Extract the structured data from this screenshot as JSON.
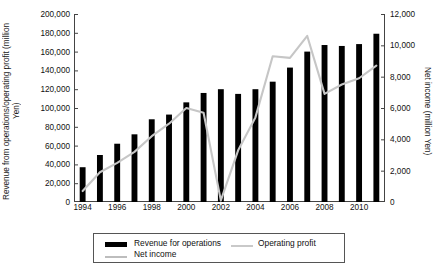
{
  "chart_data": {
    "type": "bar",
    "title": "",
    "subtitle": "",
    "xlabel": "",
    "ylabel": "Revenue from operations/operating profit (million Yen)",
    "y2label": "Net income (million Yen)",
    "ylim": [
      0,
      200000
    ],
    "y2lim": [
      0,
      12000
    ],
    "grid": false,
    "legend_position": "bottom",
    "categories": [
      "1994",
      "1995",
      "1996",
      "1997",
      "1998",
      "1999",
      "2000",
      "2001",
      "2002",
      "2003",
      "2004",
      "2005",
      "2006",
      "2007",
      "2008",
      "2009",
      "2010",
      "2011"
    ],
    "x_tick_labels": [
      "1994",
      "1996",
      "1998",
      "2000",
      "2002",
      "2004",
      "2006",
      "2008",
      "2010"
    ],
    "y_tick_labels": [
      "200,000",
      "180,000",
      "160,000",
      "140,000",
      "120,000",
      "100,000",
      "80,000",
      "60,000",
      "40,000",
      "20,000",
      "0"
    ],
    "y2_tick_labels": [
      "12,000",
      "10,000",
      "8,000",
      "6,000",
      "4,000",
      "2,000",
      "0"
    ],
    "series": [
      {
        "name": "Revenue for operations",
        "type": "bar",
        "axis": "left",
        "color": "#000000",
        "values": [
          37000,
          50000,
          62000,
          72000,
          88000,
          93000,
          106000,
          116000,
          120000,
          115000,
          120000,
          128000,
          143000,
          160000,
          167000,
          166000,
          168000,
          179000
        ]
      },
      {
        "name": "Operating profit",
        "type": "line",
        "axis": "left",
        "color": "#e2e2e2",
        "values": [
          null,
          null,
          null,
          null,
          null,
          null,
          null,
          null,
          null,
          null,
          null,
          null,
          null,
          null,
          null,
          null,
          null,
          null
        ]
      },
      {
        "name": "Net income",
        "type": "line",
        "axis": "right",
        "color": "#c6c6c6",
        "values": [
          700,
          1900,
          2500,
          3200,
          4200,
          5000,
          6000,
          5700,
          100,
          3300,
          5400,
          9300,
          9200,
          10600,
          6900,
          7500,
          7900,
          8700
        ]
      }
    ]
  },
  "legend": {
    "items": [
      {
        "label": "Revenue for operations",
        "marker": "bar",
        "color": "#000000"
      },
      {
        "label": "Operating profit",
        "marker": "line",
        "color": "#e4e4e4"
      },
      {
        "label": "Net income",
        "marker": "line",
        "color": "#c2c2c2"
      }
    ]
  }
}
